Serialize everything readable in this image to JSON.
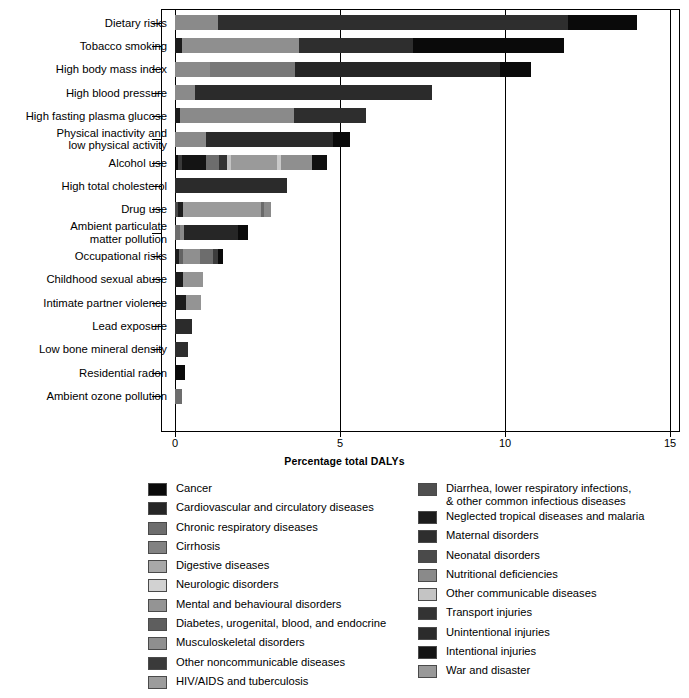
{
  "chart_data": {
    "type": "bar",
    "orientation": "horizontal",
    "stacked": true,
    "title": "",
    "xlabel": "Percentage total DALYs",
    "ylabel": "",
    "xlim": [
      0,
      15
    ],
    "xticks": [
      0,
      5,
      10,
      15
    ],
    "xtick_labels": [
      "0",
      "5",
      "10",
      "15"
    ],
    "grid": "vertical",
    "legend_position": "bottom",
    "categories": [
      "Dietary risks",
      "Tobacco smoking",
      "High body mass index",
      "High blood pressure",
      "High fasting plasma glucose",
      "Physical inactivity and\nlow physical activity",
      "Alcohol use",
      "High total cholesterol",
      "Drug use",
      "Ambient particulate\nmatter pollution",
      "Occupational risks",
      "Childhood sexual abuse",
      "Intimate partner violence",
      "Lead exposure",
      "Low bone mineral density",
      "Residential radon",
      "Ambient ozone pollution"
    ],
    "totals": [
      14.0,
      11.8,
      10.8,
      7.8,
      5.8,
      5.3,
      4.6,
      3.4,
      2.9,
      2.2,
      1.45,
      0.85,
      0.8,
      0.5,
      0.4,
      0.3,
      0.2
    ],
    "series_names": [
      "Cancer",
      "Cardiovascular and circulatory diseases",
      "Chronic respiratory diseases",
      "Cirrhosis",
      "Digestive diseases",
      "Neurologic disorders",
      "Mental and behavioural disorders",
      "Diabetes, urogenital, blood, and endocrine",
      "Musculoskeletal disorders",
      "Other noncommunicable diseases",
      "HIV/AIDS and tuberculosis",
      "Diarrhea, lower respiratory infections,\n& other common infectious diseases",
      "Neglected tropical diseases and malaria",
      "Maternal disorders",
      "Neonatal disorders",
      "Nutritional deficiencies",
      "Other communicable diseases",
      "Transport injuries",
      "Unintentional injuries",
      "Intentional injuries",
      "War and disaster"
    ],
    "bars": [
      {
        "category": "Dietary risks",
        "total": 14.0,
        "segments": [
          {
            "series": "Diabetes, urogenital, blood, and endocrine",
            "value": 1.3,
            "color": "#8a8a8a"
          },
          {
            "series": "Cardiovascular and circulatory diseases",
            "value": 10.6,
            "color": "#2e2e2e"
          },
          {
            "series": "Cancer",
            "value": 2.1,
            "color": "#0a0a0a"
          }
        ]
      },
      {
        "category": "Tobacco smoking",
        "total": 11.8,
        "segments": [
          {
            "series": "Other noncommunicable diseases",
            "value": 0.22,
            "color": "#1c1c1c"
          },
          {
            "series": "Chronic respiratory diseases",
            "value": 3.55,
            "color": "#8f8f8f"
          },
          {
            "series": "Cardiovascular and circulatory diseases",
            "value": 3.45,
            "color": "#2e2e2e"
          },
          {
            "series": "Cancer",
            "value": 4.58,
            "color": "#0a0a0a"
          }
        ]
      },
      {
        "category": "High body mass index",
        "total": 10.8,
        "segments": [
          {
            "series": "Musculoskeletal disorders",
            "value": 1.05,
            "color": "#8a8a8a"
          },
          {
            "series": "Diabetes, urogenital, blood, and endocrine",
            "value": 2.6,
            "color": "#787878"
          },
          {
            "series": "Cardiovascular and circulatory diseases",
            "value": 6.2,
            "color": "#262626"
          },
          {
            "series": "Cancer",
            "value": 0.95,
            "color": "#0a0a0a"
          }
        ]
      },
      {
        "category": "High blood pressure",
        "total": 7.8,
        "segments": [
          {
            "series": "Diabetes, urogenital, blood, and endocrine",
            "value": 0.6,
            "color": "#8a8a8a"
          },
          {
            "series": "Cardiovascular and circulatory diseases",
            "value": 7.2,
            "color": "#2b2b2b"
          }
        ]
      },
      {
        "category": "High fasting plasma glucose",
        "total": 5.8,
        "segments": [
          {
            "series": "Other noncommunicable diseases",
            "value": 0.15,
            "color": "#1c1c1c"
          },
          {
            "series": "Diabetes, urogenital, blood, and endocrine",
            "value": 3.45,
            "color": "#8a8a8a"
          },
          {
            "series": "Cardiovascular and circulatory diseases",
            "value": 2.2,
            "color": "#2e2e2e"
          }
        ]
      },
      {
        "category": "Physical inactivity and low physical activity",
        "total": 5.3,
        "segments": [
          {
            "series": "Diabetes, urogenital, blood, and endocrine",
            "value": 0.95,
            "color": "#8a8a8a"
          },
          {
            "series": "Cardiovascular and circulatory diseases",
            "value": 3.85,
            "color": "#2b2b2b"
          },
          {
            "series": "Cancer",
            "value": 0.5,
            "color": "#0a0a0a"
          }
        ]
      },
      {
        "category": "Alcohol use",
        "total": 4.6,
        "segments": [
          {
            "series": "Cancer",
            "value": 0.1,
            "color": "#0a0a0a"
          },
          {
            "series": "Cardiovascular and circulatory diseases",
            "value": 0.12,
            "color": "#3a3a3a"
          },
          {
            "series": "Intentional injuries",
            "value": 0.72,
            "color": "#141414"
          },
          {
            "series": "Cirrhosis",
            "value": 0.4,
            "color": "#6d6d6d"
          },
          {
            "series": "Transport injuries",
            "value": 0.25,
            "color": "#333333"
          },
          {
            "series": "Other communicable diseases",
            "value": 0.1,
            "color": "#c4c4c4"
          },
          {
            "series": "Mental and behavioural disorders",
            "value": 1.4,
            "color": "#9a9a9a"
          },
          {
            "series": "Nutritional deficiencies",
            "value": 0.12,
            "color": "#c9c9c9"
          },
          {
            "series": "Musculoskeletal disorders",
            "value": 0.95,
            "color": "#8f8f8f"
          },
          {
            "series": "Unintentional injuries",
            "value": 0.44,
            "color": "#101010"
          }
        ]
      },
      {
        "category": "High total cholesterol",
        "total": 3.4,
        "segments": [
          {
            "series": "Cardiovascular and circulatory diseases",
            "value": 3.4,
            "color": "#2b2b2b"
          }
        ]
      },
      {
        "category": "Drug use",
        "total": 2.9,
        "segments": [
          {
            "series": "HIV/AIDS and tuberculosis",
            "value": 0.1,
            "color": "#4a4a4a"
          },
          {
            "series": "Other noncommunicable diseases",
            "value": 0.14,
            "color": "#1e1e1e"
          },
          {
            "series": "Mental and behavioural disorders",
            "value": 2.38,
            "color": "#9a9a9a"
          },
          {
            "series": "Intentional injuries",
            "value": 0.08,
            "color": "#6a6a6a"
          },
          {
            "series": "Unintentional injuries",
            "value": 0.2,
            "color": "#8a8a8a"
          }
        ]
      },
      {
        "category": "Ambient particulate matter pollution",
        "total": 2.2,
        "segments": [
          {
            "series": "Diarrhea, lower respiratory infections, & other common infectious diseases",
            "value": 0.16,
            "color": "#6d6d6d"
          },
          {
            "series": "Chronic respiratory diseases",
            "value": 0.12,
            "color": "#8a8a8a"
          },
          {
            "series": "Cardiovascular and circulatory diseases",
            "value": 1.62,
            "color": "#262626"
          },
          {
            "series": "Cancer",
            "value": 0.3,
            "color": "#0a0a0a"
          }
        ]
      },
      {
        "category": "Occupational risks",
        "total": 1.45,
        "segments": [
          {
            "series": "Other noncommunicable diseases",
            "value": 0.13,
            "color": "#1c1c1c"
          },
          {
            "series": "Chronic respiratory diseases",
            "value": 0.12,
            "color": "#636363"
          },
          {
            "series": "Musculoskeletal disorders",
            "value": 0.52,
            "color": "#8f8f8f"
          },
          {
            "series": "Unintentional injuries",
            "value": 0.38,
            "color": "#6d6d6d"
          },
          {
            "series": "Transport injuries",
            "value": 0.14,
            "color": "#3d3d3d"
          },
          {
            "series": "Cancer",
            "value": 0.16,
            "color": "#0a0a0a"
          }
        ]
      },
      {
        "category": "Childhood sexual abuse",
        "total": 0.85,
        "segments": [
          {
            "series": "Other noncommunicable diseases",
            "value": 0.25,
            "color": "#1c1c1c"
          },
          {
            "series": "Mental and behavioural disorders",
            "value": 0.6,
            "color": "#949494"
          }
        ]
      },
      {
        "category": "Intimate partner violence",
        "total": 0.8,
        "segments": [
          {
            "series": "Intentional injuries",
            "value": 0.33,
            "color": "#1c1c1c"
          },
          {
            "series": "Mental and behavioural disorders",
            "value": 0.47,
            "color": "#949494"
          }
        ]
      },
      {
        "category": "Lead exposure",
        "total": 0.5,
        "segments": [
          {
            "series": "Cardiovascular and circulatory diseases",
            "value": 0.5,
            "color": "#2b2b2b"
          }
        ]
      },
      {
        "category": "Low bone mineral density",
        "total": 0.4,
        "segments": [
          {
            "series": "Unintentional injuries",
            "value": 0.4,
            "color": "#2e2e2e"
          }
        ]
      },
      {
        "category": "Residential radon",
        "total": 0.3,
        "segments": [
          {
            "series": "Cancer",
            "value": 0.3,
            "color": "#0a0a0a"
          }
        ]
      },
      {
        "category": "Ambient ozone pollution",
        "total": 0.2,
        "segments": [
          {
            "series": "Chronic respiratory diseases",
            "value": 0.2,
            "color": "#6d6d6d"
          }
        ]
      }
    ]
  },
  "axis": {
    "x_title": "Percentage total DALYs",
    "x_ticks": [
      {
        "label": "0",
        "value": 0
      },
      {
        "label": "5",
        "value": 5
      },
      {
        "label": "10",
        "value": 10
      },
      {
        "label": "15",
        "value": 15
      }
    ]
  },
  "legend": {
    "left_column": [
      {
        "label": "Cancer",
        "color": "#0a0a0a"
      },
      {
        "label": "Cardiovascular and circulatory diseases",
        "color": "#262626"
      },
      {
        "label": "Chronic respiratory diseases",
        "color": "#6d6d6d"
      },
      {
        "label": "Cirrhosis",
        "color": "#828282"
      },
      {
        "label": "Digestive diseases",
        "color": "#a8a8a8"
      },
      {
        "label": "Neurologic disorders",
        "color": "#d2d2d2"
      },
      {
        "label": "Mental and behavioural disorders",
        "color": "#949494"
      },
      {
        "label": "Diabetes, urogenital, blood, and endocrine",
        "color": "#5e5e5e"
      },
      {
        "label": "Musculoskeletal disorders",
        "color": "#8f8f8f"
      },
      {
        "label": "Other noncommunicable diseases",
        "color": "#3a3a3a"
      },
      {
        "label": "HIV/AIDS and tuberculosis",
        "color": "#9c9c9c"
      }
    ],
    "right_column": [
      {
        "label": "Diarrhea, lower respiratory infections,\n& other common infectious diseases",
        "color": "#4f4f4f"
      },
      {
        "label": "Neglected tropical diseases and malaria",
        "color": "#1c1c1c"
      },
      {
        "label": "Maternal disorders",
        "color": "#2e2e2e"
      },
      {
        "label": "Neonatal disorders",
        "color": "#4a4a4a"
      },
      {
        "label": "Nutritional deficiencies",
        "color": "#8a8a8a"
      },
      {
        "label": "Other communicable diseases",
        "color": "#c4c4c4"
      },
      {
        "label": "Transport injuries",
        "color": "#333333"
      },
      {
        "label": "Unintentional injuries",
        "color": "#2b2b2b"
      },
      {
        "label": "Intentional injuries",
        "color": "#141414"
      },
      {
        "label": "War and disaster",
        "color": "#999999"
      }
    ]
  }
}
